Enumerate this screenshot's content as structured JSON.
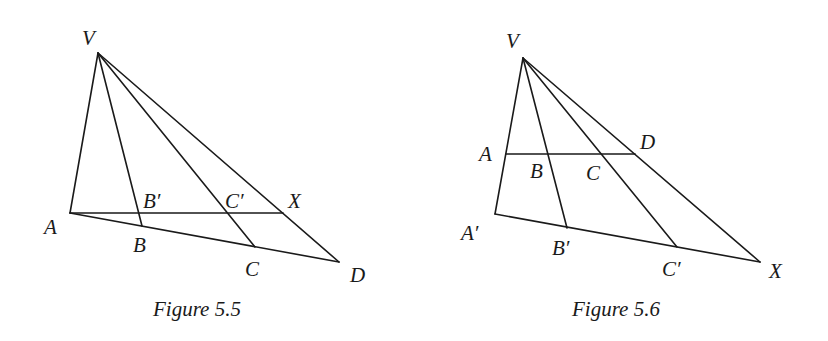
{
  "figures": [
    {
      "id": "fig55",
      "caption": "Figure 5.5",
      "points": {
        "V": {
          "label": "V",
          "x": 98,
          "y": 53
        },
        "A": {
          "label": "A",
          "x": 70,
          "y": 213
        },
        "B": {
          "label": "B",
          "x": 142,
          "y": 226
        },
        "C": {
          "label": "C",
          "x": 255,
          "y": 247
        },
        "D": {
          "label": "D",
          "x": 339,
          "y": 262
        },
        "Bp": {
          "label": "B′",
          "x": 138,
          "y": 213
        },
        "Cp": {
          "label": "C′",
          "x": 227,
          "y": 213
        },
        "X": {
          "label": "X",
          "x": 283,
          "y": 213
        }
      },
      "segments": [
        [
          "V",
          "A"
        ],
        [
          "V",
          "B"
        ],
        [
          "V",
          "C"
        ],
        [
          "V",
          "D"
        ],
        [
          "A",
          "D"
        ],
        [
          "A",
          "X"
        ]
      ]
    },
    {
      "id": "fig56",
      "caption": "Figure 5.6",
      "points": {
        "V": {
          "label": "V",
          "x": 523,
          "y": 58
        },
        "A": {
          "label": "A",
          "x": 506,
          "y": 154
        },
        "B": {
          "label": "B",
          "x": 547,
          "y": 154
        },
        "C": {
          "label": "C",
          "x": 601,
          "y": 154
        },
        "D": {
          "label": "D",
          "x": 635,
          "y": 154
        },
        "Ap": {
          "label": "A′",
          "x": 495,
          "y": 214
        },
        "Bp": {
          "label": "B′",
          "x": 567,
          "y": 228
        },
        "Cp": {
          "label": "C′",
          "x": 677,
          "y": 247
        },
        "X": {
          "label": "X",
          "x": 760,
          "y": 262
        }
      },
      "segments": [
        [
          "V",
          "Ap"
        ],
        [
          "V",
          "Bp"
        ],
        [
          "V",
          "Cp"
        ],
        [
          "V",
          "X"
        ],
        [
          "A",
          "D"
        ],
        [
          "Ap",
          "X"
        ]
      ]
    }
  ]
}
